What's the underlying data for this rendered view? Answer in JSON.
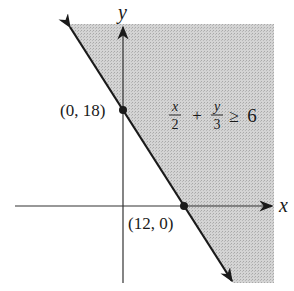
{
  "diagram": {
    "type": "linear-inequality-graph",
    "axes": {
      "x_label": "x",
      "y_label": "y"
    },
    "inequality": {
      "lhs_term1_num": "x",
      "lhs_term1_den": "2",
      "operator_plus": "+",
      "lhs_term2_num": "y",
      "lhs_term2_den": "3",
      "relation": "≥",
      "rhs": "6"
    },
    "points": [
      {
        "label": "(0, 18)",
        "x": 0,
        "y": 18
      },
      {
        "label": "(12, 0)",
        "x": 12,
        "y": 0
      }
    ],
    "boundary_line": {
      "equation": "x/2 + y/3 = 6",
      "style": "solid"
    },
    "shaded_region": "right of boundary line",
    "colors": {
      "shade": "#c8c8c8",
      "line": "#1a1a1a",
      "axis": "#333333"
    }
  }
}
